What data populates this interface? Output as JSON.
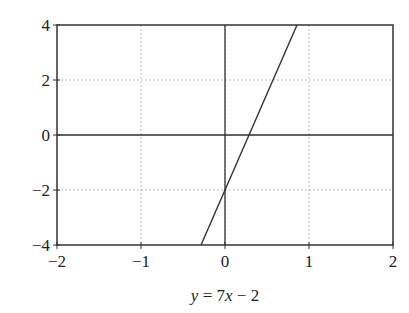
{
  "chart_data": {
    "type": "line",
    "title": "",
    "xlabel": "y = 7x − 2",
    "xlabel_parts": [
      {
        "text": "y",
        "italic": true
      },
      {
        "text": " = 7",
        "italic": false
      },
      {
        "text": "x",
        "italic": true
      },
      {
        "text": " − 2",
        "italic": false
      }
    ],
    "ylabel": "",
    "xlim": [
      -2,
      2
    ],
    "ylim": [
      -4,
      4
    ],
    "x_ticks": [
      -2,
      -1,
      0,
      1,
      2
    ],
    "x_tick_labels": [
      "−2",
      "−1",
      "0",
      "1",
      "2"
    ],
    "y_ticks": [
      -4,
      -2,
      0,
      2,
      4
    ],
    "y_tick_labels": [
      "−4",
      "−2",
      "0",
      "2",
      "4"
    ],
    "grid": true,
    "zero_axes": true,
    "legend": null,
    "series": [
      {
        "name": "y = 7x − 2",
        "equation": {
          "slope": 7,
          "intercept": -2
        },
        "x": [
          -0.2857,
          0.8571
        ],
        "y": [
          -4,
          4
        ],
        "color": "#333333"
      }
    ]
  },
  "style": {
    "frame_color": "#333333",
    "grid_color": "#bbbbbb",
    "line_color": "#333333",
    "background": "#ffffff"
  }
}
